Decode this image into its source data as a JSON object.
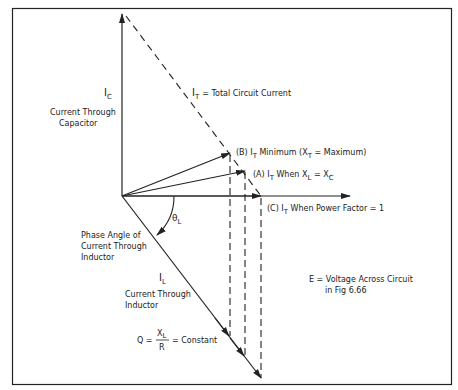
{
  "diagram": {
    "type": "phasor-diagram",
    "frame": {
      "border_color": "#222222"
    },
    "phasors": {
      "ic": {
        "symbol": "I",
        "subscript": "C",
        "desc_line1": "Current Through",
        "desc_line2": "Capacitor"
      },
      "it": {
        "symbol": "I",
        "subscript": "T",
        "desc": "= Total Circuit Current"
      },
      "il": {
        "symbol": "I",
        "subscript": "L",
        "desc_line1": "Current Through",
        "desc_line2": "Inductor"
      },
      "theta": {
        "symbol": "θ",
        "subscript": "L",
        "desc_line1": "Phase Angle of",
        "desc_line2": "Current Through",
        "desc_line3": "Inductor"
      }
    },
    "labels": {
      "b": {
        "prefix": "(B) I",
        "sub": "T",
        "mid": " Minimum (X",
        "sub2": "T",
        "suffix": " = Maximum)"
      },
      "a": {
        "prefix": "(A) I",
        "sub": "T",
        "mid": " When X",
        "sub2": "L",
        "mid2": " = X",
        "sub3": "C"
      },
      "c": {
        "prefix": "(C) I",
        "sub": "T",
        "suffix": " When Power Factor = 1"
      }
    },
    "voltage_note": {
      "line1": "E = Voltage Across Circuit",
      "line2": "in Fig 6.66"
    },
    "q_formula": {
      "lhs": "Q =",
      "num": "X",
      "num_sub": "L",
      "den": "R",
      "rhs": "= Constant"
    }
  }
}
